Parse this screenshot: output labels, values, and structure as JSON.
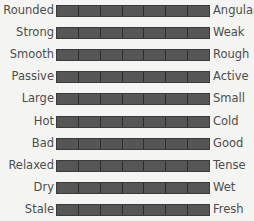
{
  "scale": {
    "segments": 7,
    "colors": {
      "bar": "#565656",
      "divider": "#2e2e2e",
      "text": "#4d4d4d",
      "background": "#f4f4f2"
    },
    "rows": [
      {
        "left": "Rounded",
        "right": "Angular"
      },
      {
        "left": "Strong",
        "right": "Weak"
      },
      {
        "left": "Smooth",
        "right": "Rough"
      },
      {
        "left": "Passive",
        "right": "Active"
      },
      {
        "left": "Large",
        "right": "Small"
      },
      {
        "left": "Hot",
        "right": "Cold"
      },
      {
        "left": "Bad",
        "right": "Good"
      },
      {
        "left": "Relaxed",
        "right": "Tense"
      },
      {
        "left": "Dry",
        "right": "Wet"
      },
      {
        "left": "Stale",
        "right": "Fresh"
      }
    ]
  }
}
